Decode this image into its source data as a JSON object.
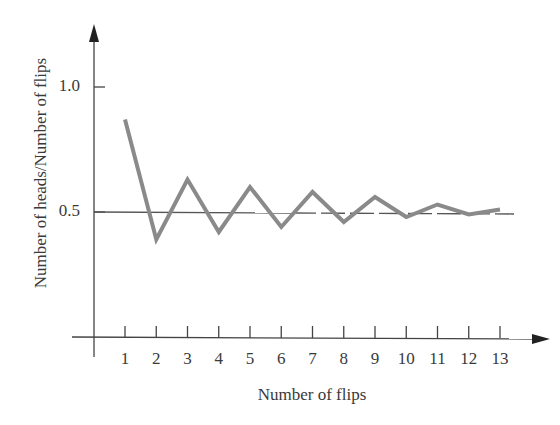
{
  "chart_data": {
    "type": "line",
    "title": "",
    "xlabel": "Number of flips",
    "ylabel": "Number of heads/Number of flips",
    "x": [
      1,
      2,
      3,
      4,
      5,
      6,
      7,
      8,
      9,
      10,
      11,
      12,
      13
    ],
    "categories": [
      "1",
      "2",
      "3",
      "4",
      "5",
      "6",
      "7",
      "8",
      "9",
      "10",
      "11",
      "12",
      "13"
    ],
    "series": [
      {
        "name": "Proportion of heads",
        "values": [
          0.87,
          0.39,
          0.63,
          0.42,
          0.6,
          0.44,
          0.58,
          0.46,
          0.56,
          0.48,
          0.53,
          0.49,
          0.51
        ],
        "color": "#8a8a8a"
      }
    ],
    "reference_lines": [
      {
        "y": 0.5,
        "style": "solid then dashed",
        "color": "#555555"
      }
    ],
    "y_ticks": [
      {
        "value": 1.0,
        "label": "1.0"
      },
      {
        "value": 0.5,
        "label": "0.5"
      }
    ],
    "xlim": [
      0,
      14
    ],
    "ylim": [
      0,
      1.2
    ],
    "grid": false,
    "legend": null
  }
}
